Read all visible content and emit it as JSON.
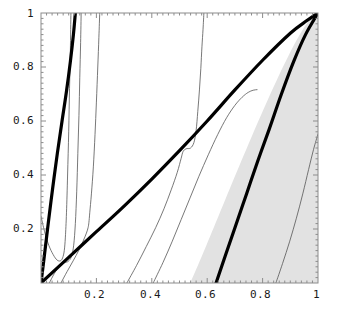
{
  "chart_data": {
    "type": "line",
    "title": "",
    "subtitle": "",
    "xlabel": "",
    "ylabel": "",
    "xlim": [
      0,
      1
    ],
    "ylim": [
      0,
      1
    ],
    "grid": false,
    "legend": null,
    "legend_position": "none",
    "background": "#ffffff",
    "frame_color": "#808080",
    "xticks": [
      0.2,
      0.4,
      0.6,
      0.8,
      1
    ],
    "xtick_labels": [
      "0.2",
      "0.4",
      "0.6",
      "0.8",
      "1"
    ],
    "yticks": [
      0.2,
      0.4,
      0.6,
      0.8,
      1
    ],
    "ytick_labels": [
      "0.2",
      "0.4",
      "0.6",
      "0.8",
      "1"
    ],
    "minor_ticks": true,
    "shaded_regions": [
      {
        "name": "gray-region",
        "color": "#e2e2e2",
        "description": "Wedge bounded on the left by a line from (0.54,0) to (1,1), filled to the right frame edge.",
        "polygon": [
          [
            0.54,
            0
          ],
          [
            1.0,
            1.0
          ],
          [
            1.0,
            0.0
          ]
        ]
      }
    ],
    "series": [
      {
        "name": "thick-curve-left",
        "style": "thick",
        "color": "#000000",
        "width_px": 3.2,
        "points": [
          [
            0.0,
            0.0
          ],
          [
            0.012,
            0.1
          ],
          [
            0.026,
            0.22
          ],
          [
            0.042,
            0.35
          ],
          [
            0.059,
            0.48
          ],
          [
            0.076,
            0.6
          ],
          [
            0.092,
            0.71
          ],
          [
            0.106,
            0.82
          ],
          [
            0.117,
            0.92
          ],
          [
            0.124,
            1.0
          ]
        ]
      },
      {
        "name": "thick-curve-diagonal",
        "style": "thick",
        "color": "#000000",
        "width_px": 3.2,
        "points": [
          [
            0.0,
            0.0
          ],
          [
            0.1,
            0.095
          ],
          [
            0.2,
            0.19
          ],
          [
            0.3,
            0.285
          ],
          [
            0.4,
            0.385
          ],
          [
            0.5,
            0.49
          ],
          [
            0.6,
            0.6
          ],
          [
            0.7,
            0.715
          ],
          [
            0.8,
            0.825
          ],
          [
            0.9,
            0.925
          ],
          [
            0.96,
            0.972
          ],
          [
            1.0,
            1.0
          ]
        ]
      },
      {
        "name": "thick-curve-right",
        "style": "thick",
        "color": "#000000",
        "width_px": 3.2,
        "points": [
          [
            0.632,
            0.0
          ],
          [
            0.665,
            0.1
          ],
          [
            0.702,
            0.21
          ],
          [
            0.742,
            0.33
          ],
          [
            0.782,
            0.45
          ],
          [
            0.824,
            0.57
          ],
          [
            0.868,
            0.7
          ],
          [
            0.912,
            0.82
          ],
          [
            0.955,
            0.92
          ],
          [
            1.0,
            1.0
          ]
        ]
      },
      {
        "name": "thin-contour-1",
        "style": "thin",
        "color": "#555555",
        "width_px": 0.8,
        "points": [
          [
            0.0,
            0.247
          ],
          [
            0.013,
            0.19
          ],
          [
            0.028,
            0.14
          ],
          [
            0.044,
            0.105
          ],
          [
            0.058,
            0.085
          ],
          [
            0.07,
            0.082
          ],
          [
            0.078,
            0.093
          ],
          [
            0.084,
            0.12
          ],
          [
            0.088,
            0.17
          ],
          [
            0.092,
            0.26
          ],
          [
            0.096,
            0.4
          ],
          [
            0.1,
            0.56
          ],
          [
            0.103,
            0.72
          ],
          [
            0.106,
            0.86
          ],
          [
            0.108,
            1.0
          ]
        ]
      },
      {
        "name": "thin-contour-2",
        "style": "thin",
        "color": "#555555",
        "width_px": 0.8,
        "points": [
          [
            0.03,
            0.0
          ],
          [
            0.048,
            0.035
          ],
          [
            0.066,
            0.062
          ],
          [
            0.084,
            0.075
          ],
          [
            0.098,
            0.08
          ],
          [
            0.11,
            0.098
          ],
          [
            0.118,
            0.14
          ],
          [
            0.124,
            0.22
          ],
          [
            0.129,
            0.34
          ],
          [
            0.133,
            0.48
          ],
          [
            0.137,
            0.62
          ],
          [
            0.14,
            0.76
          ],
          [
            0.143,
            0.89
          ],
          [
            0.145,
            1.0
          ]
        ]
      },
      {
        "name": "thin-contour-3",
        "style": "thin",
        "color": "#555555",
        "width_px": 0.8,
        "points": [
          [
            0.072,
            0.0
          ],
          [
            0.094,
            0.042
          ],
          [
            0.116,
            0.082
          ],
          [
            0.136,
            0.12
          ],
          [
            0.152,
            0.155
          ],
          [
            0.164,
            0.185
          ],
          [
            0.17,
            0.205
          ],
          [
            0.173,
            0.225
          ],
          [
            0.176,
            0.26
          ],
          [
            0.182,
            0.33
          ],
          [
            0.189,
            0.43
          ],
          [
            0.195,
            0.55
          ],
          [
            0.2,
            0.67
          ],
          [
            0.205,
            0.8
          ],
          [
            0.209,
            0.91
          ],
          [
            0.212,
            1.0
          ]
        ]
      },
      {
        "name": "thin-contour-4",
        "style": "thin",
        "color": "#555555",
        "width_px": 0.8,
        "points": [
          [
            0.31,
            0.0
          ],
          [
            0.345,
            0.065
          ],
          [
            0.38,
            0.135
          ],
          [
            0.414,
            0.205
          ],
          [
            0.444,
            0.275
          ],
          [
            0.47,
            0.345
          ],
          [
            0.492,
            0.41
          ],
          [
            0.506,
            0.462
          ],
          [
            0.513,
            0.487
          ],
          [
            0.524,
            0.497
          ],
          [
            0.54,
            0.5
          ],
          [
            0.552,
            0.52
          ],
          [
            0.56,
            0.565
          ],
          [
            0.566,
            0.635
          ],
          [
            0.572,
            0.715
          ],
          [
            0.577,
            0.795
          ],
          [
            0.581,
            0.875
          ],
          [
            0.585,
            0.94
          ],
          [
            0.588,
            1.0
          ]
        ]
      },
      {
        "name": "thin-contour-5",
        "style": "thin",
        "color": "#555555",
        "width_px": 0.8,
        "points": [
          [
            0.405,
            0.0
          ],
          [
            0.44,
            0.075
          ],
          [
            0.474,
            0.155
          ],
          [
            0.506,
            0.235
          ],
          [
            0.538,
            0.315
          ],
          [
            0.57,
            0.395
          ],
          [
            0.604,
            0.475
          ],
          [
            0.638,
            0.55
          ],
          [
            0.67,
            0.612
          ],
          [
            0.7,
            0.658
          ],
          [
            0.726,
            0.688
          ],
          [
            0.748,
            0.706
          ],
          [
            0.766,
            0.714
          ],
          [
            0.78,
            0.716
          ]
        ]
      },
      {
        "name": "thin-contour-6",
        "style": "thin",
        "color": "#555555",
        "width_px": 0.8,
        "points": [
          [
            0.848,
            0.0
          ],
          [
            0.872,
            0.072
          ],
          [
            0.898,
            0.155
          ],
          [
            0.922,
            0.24
          ],
          [
            0.945,
            0.33
          ],
          [
            0.966,
            0.42
          ],
          [
            0.984,
            0.495
          ],
          [
            1.0,
            0.552
          ]
        ]
      }
    ]
  }
}
